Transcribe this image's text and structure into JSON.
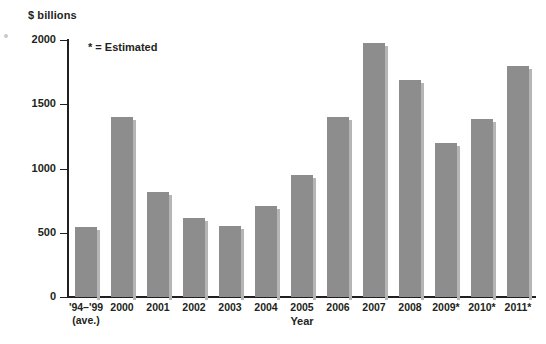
{
  "chart_data": {
    "type": "bar",
    "title": "",
    "xlabel": "Year",
    "ylabel": "$ billions",
    "ylim": [
      0,
      2000
    ],
    "yticks": [
      0,
      500,
      1000,
      1500,
      2000
    ],
    "ytick_labels": [
      "0",
      "500",
      "1000",
      "1500",
      "2000"
    ],
    "grid": false,
    "legend": false,
    "annotation": "* = Estimated",
    "bar_color": "#8d8d8d",
    "categories": [
      "'94–'99",
      "2000",
      "2001",
      "2002",
      "2003",
      "2004",
      "2005",
      "2006",
      "2007",
      "2008",
      "2009*",
      "2010*",
      "2011*"
    ],
    "category_sublabels": [
      "(ave.)",
      "",
      "",
      "",
      "",
      "",
      "",
      "",
      "",
      "",
      "",
      "",
      ""
    ],
    "values": [
      545,
      1400,
      820,
      615,
      550,
      710,
      950,
      1400,
      1975,
      1685,
      1195,
      1385,
      1795
    ]
  }
}
